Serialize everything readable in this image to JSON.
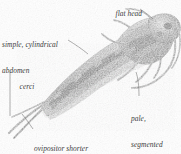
{
  "figure": {
    "background_color": "#ffffff",
    "specimen_color": "#9a9a9a",
    "label_color": "#3c3c3c",
    "leader_color": "#6d6d6d",
    "width": 181,
    "height": 154
  },
  "labels": {
    "flat_head": "flat head",
    "abdomen_line1": "simple, cylindrical",
    "abdomen_line2": "abdomen",
    "cerci": "cerci",
    "antennae_line1": "pale,",
    "antennae_line2": "segmented",
    "antennae_line3": "antennae",
    "ovipositor_line1": "ovipositor shorter",
    "ovipositor_line2": "than cerci"
  }
}
